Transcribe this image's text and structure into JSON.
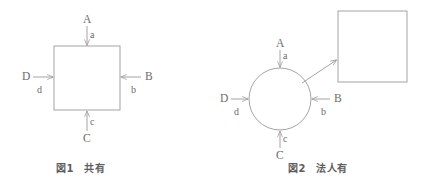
{
  "figure": {
    "background_color": "#ffffff",
    "line_color": "#9a9a9a",
    "text_color": "#6b6b6b",
    "caption_color": "#5e5e5e"
  },
  "fig1": {
    "caption": "図1　共有",
    "shape": "square",
    "inputs": [
      {
        "id": "top",
        "upper": "A",
        "lower": "a",
        "direction": "down"
      },
      {
        "id": "right",
        "upper": "B",
        "lower": "b",
        "direction": "left"
      },
      {
        "id": "bottom",
        "upper": "C",
        "lower": "c",
        "direction": "up"
      },
      {
        "id": "left",
        "upper": "D",
        "lower": "d",
        "direction": "right"
      }
    ]
  },
  "fig2": {
    "caption": "図2　法人有",
    "shape": "circle",
    "output_shape": "square",
    "inputs": [
      {
        "id": "top",
        "upper": "A",
        "lower": "a",
        "direction": "down"
      },
      {
        "id": "right",
        "upper": "B",
        "lower": "b",
        "direction": "left"
      },
      {
        "id": "bottom",
        "upper": "C",
        "lower": "c",
        "direction": "up"
      },
      {
        "id": "left",
        "upper": "D",
        "lower": "d",
        "direction": "right"
      }
    ],
    "output_arrow": {
      "direction": "up-right"
    }
  }
}
